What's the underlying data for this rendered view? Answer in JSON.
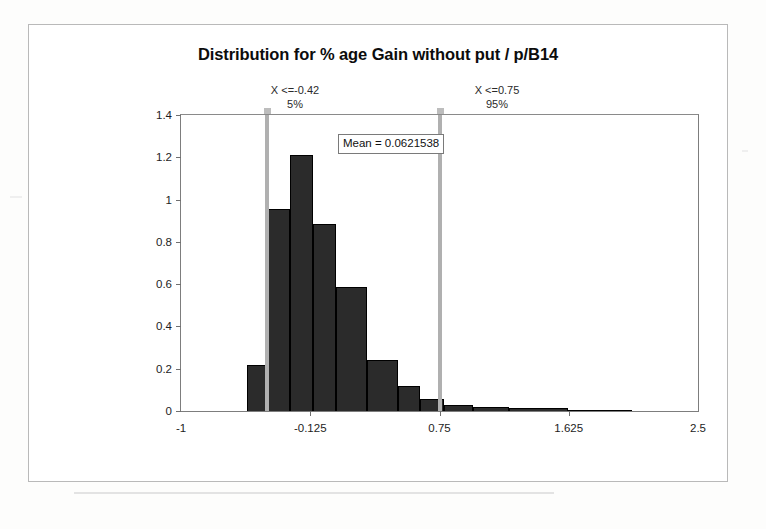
{
  "chart_data": {
    "type": "bar",
    "title": "Distribution for % age Gain without put / p/B14",
    "xlabel": "",
    "ylabel": "",
    "xlim": [
      -1,
      2.5
    ],
    "ylim": [
      0,
      1.4
    ],
    "xticks": [
      "-1",
      "-0.125",
      "0.75",
      "1.625",
      "2.5"
    ],
    "xtick_values": [
      -1,
      -0.125,
      0.75,
      1.625,
      2.5
    ],
    "yticks": [
      "0",
      "0.2",
      "0.4",
      "0.6",
      "0.8",
      "1",
      "1.2",
      "1.4"
    ],
    "ytick_values": [
      0,
      0.2,
      0.4,
      0.6,
      0.8,
      1,
      1.2,
      1.4
    ],
    "grid": false,
    "legend": null,
    "bin_edges": [
      -0.685,
      -0.55,
      -0.415,
      -0.28,
      -0.145,
      -0.01,
      0.125,
      0.26,
      0.395,
      0.53,
      0.665,
      0.8,
      0.935,
      1.07,
      1.205,
      1.34,
      1.475,
      1.61,
      1.745,
      1.88,
      2.015,
      2.15
    ],
    "bars": [
      {
        "x0": -0.685,
        "x1": -0.55,
        "value": 0.0
      },
      {
        "x0": -0.55,
        "x1": -0.415,
        "value": 0.22
      },
      {
        "x0": -0.415,
        "x1": -0.26,
        "value": 0.955
      },
      {
        "x0": -0.26,
        "x1": -0.105,
        "value": 1.21
      },
      {
        "x0": -0.105,
        "x1": 0.05,
        "value": 0.885
      },
      {
        "x0": 0.05,
        "x1": 0.26,
        "value": 0.585
      },
      {
        "x0": 0.26,
        "x1": 0.47,
        "value": 0.24
      },
      {
        "x0": 0.47,
        "x1": 0.62,
        "value": 0.12
      },
      {
        "x0": 0.62,
        "x1": 0.78,
        "value": 0.055
      },
      {
        "x0": 0.78,
        "x1": 0.98,
        "value": 0.03
      },
      {
        "x0": 0.98,
        "x1": 1.22,
        "value": 0.018
      },
      {
        "x0": 1.22,
        "x1": 1.62,
        "value": 0.012
      },
      {
        "x0": 1.62,
        "x1": 2.05,
        "value": 0.006
      }
    ],
    "values": [
      0.22,
      0.955,
      1.21,
      0.885,
      0.585,
      0.24,
      0.12,
      0.055,
      0.03,
      0.018,
      0.012,
      0.006
    ],
    "annotations": {
      "mean_label": "Mean = 0.0621538",
      "mean_value": 0.0621538,
      "percentiles": [
        {
          "label": "X <=-0.42",
          "percent": "5%",
          "value": -0.42
        },
        {
          "label": "X <=0.75",
          "percent": "95%",
          "value": 0.75
        }
      ]
    },
    "colors": {
      "bar_fill": "#2b2b2b",
      "bar_edge": "#000000",
      "axis": "#7d7d7d",
      "percentile_line": "#b0b0b0",
      "background": "#ffffff",
      "text": "#1d1d1d"
    }
  }
}
